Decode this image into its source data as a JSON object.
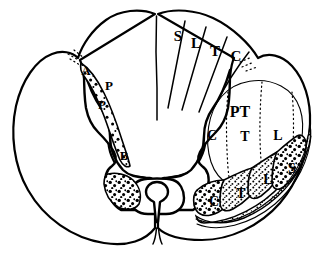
{
  "figure": {
    "background_color": "#ffffff",
    "ink_color": "#000000",
    "width": 321,
    "height": 259
  },
  "posterior_columns": {
    "region_name": "posterior-columns",
    "wedges": [
      {
        "label": "S",
        "x": 178,
        "y": 38
      },
      {
        "label": "L",
        "x": 196,
        "y": 45
      },
      {
        "label": "T",
        "x": 215,
        "y": 53
      },
      {
        "label": "C",
        "x": 236,
        "y": 58
      }
    ]
  },
  "corticospinal_tract": {
    "region_name": "lateral-corticospinal-tract",
    "tract_label": "PT",
    "tract_label_pos": {
      "x": 240,
      "y": 113
    },
    "segments": [
      {
        "label": "C",
        "x": 212,
        "y": 137
      },
      {
        "label": "T",
        "x": 245,
        "y": 138
      },
      {
        "label": "L",
        "x": 278,
        "y": 137
      }
    ]
  },
  "spinothalamic_tract": {
    "region_name": "lateral-spinothalamic-tract",
    "segments": [
      {
        "label": "C",
        "x": 214,
        "y": 203
      },
      {
        "label": "T",
        "x": 241,
        "y": 195
      },
      {
        "label": "L",
        "x": 268,
        "y": 181
      },
      {
        "label": "S",
        "x": 292,
        "y": 170
      }
    ]
  },
  "left_side_labels": {
    "region_name": "left-degeneration-markers",
    "markers": [
      {
        "label": "A",
        "x": 86,
        "y": 72
      },
      {
        "label": "P",
        "x": 109,
        "y": 87
      },
      {
        "label": "P",
        "x": 102,
        "y": 106
      },
      {
        "label": "B",
        "x": 124,
        "y": 157
      }
    ]
  },
  "central_canal": {
    "region_name": "central-canal",
    "shape": "teardrop"
  }
}
